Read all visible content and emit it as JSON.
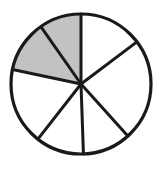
{
  "figure": {
    "kind": "fraction-circle-diagram",
    "title": "Fraction circle divided into seven equal sectors with two sectors shaded",
    "background_color": "#ffffff"
  },
  "chart_data": {
    "type": "pie",
    "title": "",
    "subtitle": "",
    "xlabel": "",
    "ylabel": "",
    "legend": [],
    "legend_position": "none",
    "grid": false,
    "total_sectors": 7,
    "shaded_sectors": 2,
    "unshaded_sectors": 5,
    "fraction_shaded": "2/7",
    "categories": [
      "sector-1",
      "sector-2",
      "sector-3",
      "sector-4",
      "sector-5",
      "sector-6",
      "sector-7"
    ],
    "values": [
      1,
      1,
      1,
      1,
      1,
      1,
      1
    ],
    "series": [
      {
        "name": "sectors",
        "values": [
          1,
          1,
          1,
          1,
          1,
          1,
          1
        ]
      }
    ],
    "sectors": [
      {
        "id": "sector-1",
        "shaded": true,
        "fill": "#c2c2c2",
        "start_angle_deg": 90,
        "end_angle_deg": 125,
        "sweep_deg": 35
      },
      {
        "id": "sector-2",
        "shaded": true,
        "fill": "#c2c2c2",
        "start_angle_deg": 125,
        "end_angle_deg": 168,
        "sweep_deg": 43
      },
      {
        "id": "sector-3",
        "shaded": false,
        "fill": "#ffffff",
        "start_angle_deg": 168,
        "end_angle_deg": 232,
        "sweep_deg": 64
      },
      {
        "id": "sector-4",
        "shaded": false,
        "fill": "#ffffff",
        "start_angle_deg": 232,
        "end_angle_deg": 272,
        "sweep_deg": 40
      },
      {
        "id": "sector-5",
        "shaded": false,
        "fill": "#ffffff",
        "start_angle_deg": 272,
        "end_angle_deg": 312,
        "sweep_deg": 40
      },
      {
        "id": "sector-6",
        "shaded": false,
        "fill": "#ffffff",
        "start_angle_deg": 312,
        "end_angle_deg": 397,
        "sweep_deg": 85
      },
      {
        "id": "sector-7",
        "shaded": false,
        "fill": "#ffffff",
        "start_angle_deg": 37,
        "end_angle_deg": 90,
        "sweep_deg": 53
      }
    ],
    "geometry": {
      "center_x": 81,
      "center_y": 84,
      "radius": 70,
      "outline_color": "#1a1a1a",
      "outline_width": 3.2,
      "divider_color": "#1a1a1a",
      "divider_width": 3.0,
      "shaded_fill": "#c2c2c2",
      "unshaded_fill": "#ffffff"
    }
  }
}
